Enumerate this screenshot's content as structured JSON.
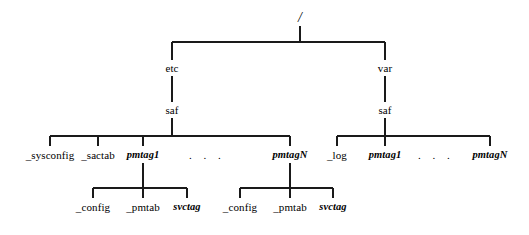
{
  "diagram": {
    "type": "tree",
    "background_color": "#ffffff",
    "line_color": "#1a1a1a",
    "text_color": "#000000",
    "nodes": {
      "root": {
        "label": "/",
        "x": 300,
        "y": 18,
        "style": "root"
      },
      "etc": {
        "label": "etc",
        "x": 172,
        "y": 68,
        "style": "plain"
      },
      "var": {
        "label": "var",
        "x": 385,
        "y": 68,
        "style": "plain"
      },
      "etc_saf": {
        "label": "saf",
        "x": 172,
        "y": 110,
        "style": "plain"
      },
      "var_saf": {
        "label": "saf",
        "x": 385,
        "y": 110,
        "style": "plain"
      },
      "sysconfig": {
        "label": "_sysconfig",
        "x": 50,
        "y": 155,
        "style": "plain"
      },
      "sactab": {
        "label": "_sactab",
        "x": 98,
        "y": 155,
        "style": "plain"
      },
      "etc_pmtag1": {
        "label": "pmtag1",
        "x": 143,
        "y": 155,
        "style": "italic"
      },
      "etc_ellipsis": {
        "label": ". . .",
        "x": 207,
        "y": 155,
        "style": "ellipsis"
      },
      "etc_pmtagN": {
        "label": "pmtagN",
        "x": 290,
        "y": 155,
        "style": "italic"
      },
      "log": {
        "label": "_log",
        "x": 337,
        "y": 155,
        "style": "plain"
      },
      "var_pmtag1": {
        "label": "pmtag1",
        "x": 385,
        "y": 155,
        "style": "italic"
      },
      "var_ellipsis": {
        "label": ". . .",
        "x": 436,
        "y": 155,
        "style": "ellipsis"
      },
      "var_pmtagN": {
        "label": "pmtagN",
        "x": 490,
        "y": 155,
        "style": "italic"
      },
      "pmtag1_config": {
        "label": "_config",
        "x": 93,
        "y": 207,
        "style": "plain"
      },
      "pmtag1_pmtab": {
        "label": "_pmtab",
        "x": 143,
        "y": 207,
        "style": "plain"
      },
      "pmtag1_svctag": {
        "label": "svctag",
        "x": 187,
        "y": 207,
        "style": "italic"
      },
      "pmtagN_config": {
        "label": "_config",
        "x": 240,
        "y": 207,
        "style": "plain"
      },
      "pmtagN_pmtab": {
        "label": "_pmtab",
        "x": 290,
        "y": 207,
        "style": "plain"
      },
      "pmtagN_svctag": {
        "label": "svctag",
        "x": 333,
        "y": 207,
        "style": "italic"
      }
    },
    "edges": {
      "root_stem": {
        "x": 300,
        "y1": 26,
        "y2": 42
      },
      "root_bus": {
        "y": 42,
        "x1": 172,
        "x2": 385
      },
      "etc_drop": {
        "x": 172,
        "y1": 42,
        "y2": 60
      },
      "var_drop": {
        "x": 385,
        "y1": 42,
        "y2": 60
      },
      "etc_to_saf": {
        "x": 172,
        "y1": 76,
        "y2": 102
      },
      "var_to_saf": {
        "x": 385,
        "y1": 76,
        "y2": 102
      },
      "etc_saf_stem": {
        "x": 172,
        "y1": 118,
        "y2": 136
      },
      "etc_saf_bus": {
        "y": 136,
        "x1": 50,
        "x2": 290
      },
      "var_saf_stem": {
        "x": 385,
        "y1": 118,
        "y2": 136
      },
      "var_saf_bus": {
        "y": 136,
        "x1": 337,
        "x2": 490
      },
      "etc_leaf_drops": [
        50,
        98,
        143,
        290
      ],
      "var_leaf_drops": [
        337,
        385,
        490
      ],
      "leaf_drop_y1": 136,
      "leaf_drop_y2": 146,
      "pmtag1_stem": {
        "x": 143,
        "y1": 163,
        "y2": 188
      },
      "pmtag1_bus": {
        "y": 188,
        "x1": 93,
        "x2": 187
      },
      "pmtag1_child_drops": [
        93,
        143,
        187
      ],
      "pmtagN_stem": {
        "x": 290,
        "y1": 163,
        "y2": 188
      },
      "pmtagN_bus": {
        "y": 188,
        "x1": 240,
        "x2": 333
      },
      "pmtagN_child_drops": [
        240,
        290,
        333
      ],
      "child_drop_y1": 188,
      "child_drop_y2": 198
    }
  }
}
